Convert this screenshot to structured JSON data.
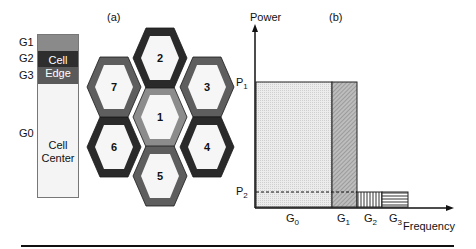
{
  "panel_a": {
    "label": "(a)",
    "bar": {
      "group_labels": [
        "G1",
        "G2",
        "G3",
        "G0"
      ],
      "edge_label_line1": "Cell",
      "edge_label_line2": "Edge",
      "center_label_line1": "Cell",
      "center_label_line2": "Center",
      "colors": {
        "G1": "#8a8a8a",
        "G2": "#2e2e2e",
        "G3": "#5a5a5a",
        "G0": "#f4f4f4"
      }
    },
    "hexagons": [
      {
        "id": "1",
        "label": "1",
        "cx": 160,
        "cy": 117,
        "border": "#8c8c8c"
      },
      {
        "id": "2",
        "label": "2",
        "cx": 160,
        "cy": 58,
        "border": "#2a2a2a"
      },
      {
        "id": "3",
        "label": "3",
        "cx": 207,
        "cy": 87,
        "border": "#5e5e5e"
      },
      {
        "id": "4",
        "label": "4",
        "cx": 207,
        "cy": 147,
        "border": "#2a2a2a"
      },
      {
        "id": "5",
        "label": "5",
        "cx": 160,
        "cy": 176,
        "border": "#5e5e5e"
      },
      {
        "id": "6",
        "label": "6",
        "cx": 114,
        "cy": 147,
        "border": "#2a2a2a"
      },
      {
        "id": "7",
        "label": "7",
        "cx": 114,
        "cy": 87,
        "border": "#5e5e5e"
      }
    ]
  },
  "panel_b": {
    "label": "(b)",
    "y_axis_label": "Power",
    "x_axis_label": "Frequency",
    "p1_label": "P",
    "p1_sub": "1",
    "p2_label": "P",
    "p2_sub": "2",
    "x_ticks": [
      {
        "main": "G",
        "sub": "0"
      },
      {
        "main": "G",
        "sub": "1"
      },
      {
        "main": "G",
        "sub": "2"
      },
      {
        "main": "G",
        "sub": "3"
      }
    ]
  },
  "chart_data": {
    "type": "bar",
    "title": "(b)",
    "xlabel": "Frequency",
    "ylabel": "Power",
    "categories": [
      "G0",
      "G1",
      "G2",
      "G3"
    ],
    "values": [
      "P1",
      "P1",
      "P2",
      "P2"
    ],
    "relative_widths": [
      3,
      1,
      1,
      1
    ],
    "levels": {
      "P1": "high power (cell center / G0, G1)",
      "P2": "low power (G2, G3)"
    },
    "annotations": [
      "dashed line at P2 across all bands"
    ],
    "grid": false,
    "legend": null
  }
}
